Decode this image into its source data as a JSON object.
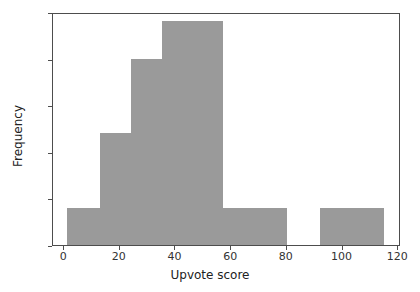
{
  "chart_data": {
    "type": "bar",
    "title": "",
    "xlabel": "Upvote score",
    "ylabel": "Frequency",
    "xlim": [
      -4,
      121
    ],
    "ylim": [
      0,
      25
    ],
    "grid": false,
    "legend": null,
    "bar_color": "#9a9a9a",
    "bin_edges": [
      1,
      13,
      24,
      35,
      57,
      80,
      92,
      115
    ],
    "categories": [
      "1-13",
      "13-24",
      "24-35",
      "35-57",
      "57-80",
      "80-92",
      "92-115"
    ],
    "values": [
      4,
      12,
      20,
      24,
      4,
      0,
      4
    ],
    "xticks": [
      0,
      20,
      40,
      60,
      80,
      100,
      120
    ],
    "xtick_labels": [
      "0",
      "20",
      "40",
      "60",
      "80",
      "100",
      "120"
    ],
    "yticks": [
      0,
      5,
      10,
      15,
      20,
      25
    ],
    "ytick_labels": [
      "0",
      "5",
      "10",
      "15",
      "20",
      "25"
    ]
  },
  "axes": {
    "frame_color": "#4d4d4d",
    "text_color": "#333333"
  }
}
